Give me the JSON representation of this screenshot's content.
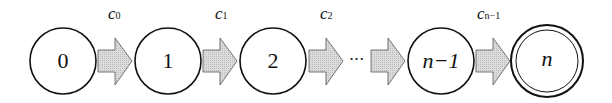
{
  "diagram": {
    "type": "state-chain",
    "nodes": [
      {
        "id": "0",
        "label": "0",
        "accepting": false
      },
      {
        "id": "1",
        "label": "1",
        "accepting": false
      },
      {
        "id": "2",
        "label": "2",
        "accepting": false
      },
      {
        "id": "n-1",
        "label": "n−1",
        "accepting": false
      },
      {
        "id": "n",
        "label": "n",
        "accepting": true
      }
    ],
    "edges": [
      {
        "from": "0",
        "to": "1",
        "label_base": "c",
        "label_sub": "0"
      },
      {
        "from": "1",
        "to": "2",
        "label_base": "c",
        "label_sub": "1"
      },
      {
        "from": "2",
        "to": "…",
        "label_base": "c",
        "label_sub": "2"
      },
      {
        "from": "…",
        "to": "n-1",
        "label_base": "",
        "label_sub": ""
      },
      {
        "from": "n-1",
        "to": "n",
        "label_base": "c",
        "label_sub": "n−1"
      }
    ],
    "ellipsis": "···",
    "colors": {
      "arrow_fill": "#d4d4d4",
      "stroke": "#111111",
      "background": "#ffffff"
    }
  }
}
